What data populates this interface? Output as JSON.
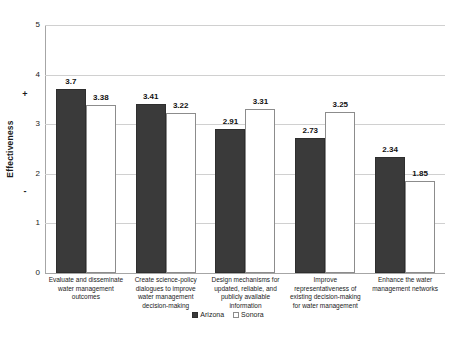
{
  "chart_data": {
    "type": "bar",
    "title": "",
    "xlabel": "",
    "ylabel": "Effectiveness",
    "ylim": [
      0,
      5
    ],
    "ytick_labels": [
      "5",
      "4",
      "3",
      "2",
      "1",
      "0"
    ],
    "yticks": [
      5,
      4,
      3,
      2,
      1,
      0
    ],
    "grid": true,
    "legend_position": "bottom-center",
    "axis_sign_high": "+",
    "axis_sign_low": "-",
    "categories": [
      "Evaluate and disseminate water management outcomes",
      "Create science-policy dialogues to improve water management decision-making",
      "Design mechanisms for updated, reliable, and publicly available information",
      "Improve representativeness of existing decision-making for water management",
      "Enhance the water management networks"
    ],
    "series": [
      {
        "name": "Arizona",
        "color": "#3a3a3a",
        "values": [
          3.7,
          3.41,
          2.91,
          2.73,
          2.34
        ],
        "value_labels": [
          "3.7",
          "3.41",
          "2.91",
          "2.73",
          "2.34"
        ]
      },
      {
        "name": "Sonora",
        "color": "#ffffff",
        "border_color": "#8c8c8c",
        "values": [
          3.38,
          3.22,
          3.31,
          3.25,
          1.85
        ],
        "value_labels": [
          "3.38",
          "3.22",
          "3.31",
          "3.25",
          "1.85"
        ]
      }
    ]
  },
  "legend": {
    "items": [
      {
        "label": "Arizona",
        "style": "filled"
      },
      {
        "label": "Sonora",
        "style": "outline"
      }
    ]
  }
}
